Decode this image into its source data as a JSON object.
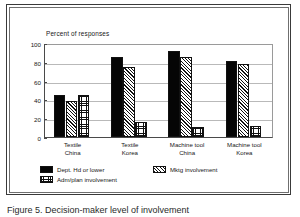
{
  "figure": {
    "caption": "Figure 5. Decision-maker level of involvement"
  },
  "chart_data": {
    "type": "bar",
    "title": "",
    "axis_note": "Percent of responses",
    "xlabel": "",
    "ylabel": "Percent of responses",
    "ylim": [
      0,
      100
    ],
    "yticks": [
      0,
      20,
      40,
      60,
      80,
      100
    ],
    "grid": true,
    "legend_position": "bottom-left",
    "categories": [
      "Textile China",
      "Textile Korea",
      "Machine tool China",
      "Machine tool Korea"
    ],
    "category_lines": [
      [
        "Textile",
        "China"
      ],
      [
        "Textile",
        "Korea"
      ],
      [
        "Machine tool",
        "China"
      ],
      [
        "Machine tool",
        "Korea"
      ]
    ],
    "series": [
      {
        "name": "Dept. Hd or lower",
        "pattern": "solid-black",
        "values": [
          45,
          85,
          91,
          81
        ]
      },
      {
        "name": "Mktg involvement",
        "pattern": "diagonal-hatch",
        "values": [
          38,
          74,
          85,
          78
        ]
      },
      {
        "name": "Adm/plan involvement",
        "pattern": "cross-hatch-grid",
        "values": [
          45,
          16,
          11,
          12
        ]
      }
    ]
  },
  "axis": {
    "ylabel_text": "Percent of responses",
    "ytick_labels": [
      "100",
      "80",
      "60",
      "40",
      "20",
      "0"
    ]
  },
  "legend": {
    "items": [
      {
        "label": "Dept. Hd or lower"
      },
      {
        "label": "Mktg involvement"
      },
      {
        "label": "Adm/plan involvement"
      }
    ]
  },
  "colors": {
    "ink": "#111111",
    "frame_outer": "#3a3a3a",
    "frame_inner": "#6f6f6f",
    "gridline": "#b9b9b9",
    "background": "#ffffff"
  }
}
